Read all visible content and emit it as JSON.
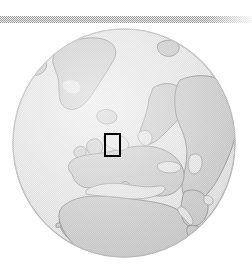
{
  "figure": {
    "width": 252,
    "height": 272,
    "background_color": "#ffffff",
    "type": "locator-globe-inset"
  },
  "top_rule": {
    "name": "dithered-divider",
    "x": 0,
    "y": 16,
    "width": 252,
    "height": 7,
    "color": "#9a9a9a",
    "pattern": "50-percent-checkerboard-dither"
  },
  "globe": {
    "projection": "orthographic",
    "center_lon": 10,
    "center_lat": 30,
    "cx": 124,
    "cy": 143,
    "radius": 112,
    "ocean_color": "#ededed",
    "land_color": "#d6d6d6",
    "coastline_color": "#9d9d9d",
    "outline_color": "#c4c4c4",
    "visible_regions": [
      "Greenland",
      "Iceland",
      "Svalbard",
      "Scandinavia",
      "British Isles",
      "Europe",
      "Mediterranean Sea",
      "Black Sea",
      "Caspian Sea",
      "North Africa",
      "Sahara",
      "West Africa",
      "Central Africa",
      "Arabian Peninsula",
      "Middle East",
      "Red Sea",
      "Horn of Africa",
      "Madagascar",
      "Canary Islands"
    ]
  },
  "roi": {
    "name": "study-area-highlight",
    "label": "",
    "shape": "rectangle",
    "x": 104,
    "y": 133,
    "width": 17,
    "height": 24,
    "stroke_color": "#000000",
    "stroke_width": 2,
    "fill": "none",
    "approx_location": "Western and Central Europe"
  }
}
